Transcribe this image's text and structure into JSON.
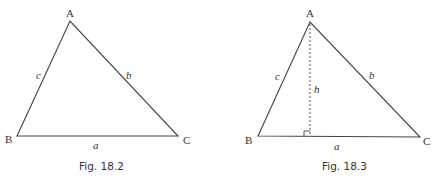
{
  "figures": [
    {
      "caption": "Fig. 18.2",
      "vertices": {
        "A": "A",
        "B": "B",
        "C": "C"
      },
      "sides": {
        "a": "a",
        "b": "b",
        "c": "c"
      }
    },
    {
      "caption": "Fig. 18.3",
      "vertices": {
        "A": "A",
        "B": "B",
        "C": "C"
      },
      "sides": {
        "a": "a",
        "b": "b",
        "c": "c"
      },
      "altitude_label": "h",
      "right_angle_marker": true
    }
  ],
  "colors": {
    "line": "#444444",
    "text": "#333333",
    "background": "#ffffff"
  }
}
